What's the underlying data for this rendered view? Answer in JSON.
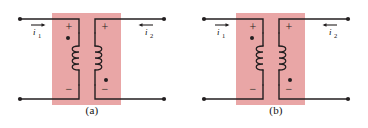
{
  "figure": {
    "type": "coupled-inductors-dot-convention",
    "colors": {
      "core_fill": "#e9a6a6",
      "wire": "#231f20",
      "background": "#ffffff",
      "label": "#111111"
    },
    "panels": [
      {
        "id": "a",
        "caption": "(a)",
        "left_terminal_current": {
          "label": "i",
          "subscript": "1",
          "arrow_direction": "right"
        },
        "right_terminal_current": {
          "label": "i",
          "subscript": "2",
          "arrow_direction": "left"
        },
        "left_coil": {
          "top_polarity": "+",
          "bottom_polarity": "−",
          "dot_position": "top",
          "winding_bulge": "left"
        },
        "right_coil": {
          "top_polarity": "+",
          "bottom_polarity": "−",
          "dot_position": "bottom",
          "winding_bulge": "right"
        }
      },
      {
        "id": "b",
        "caption": "(b)",
        "left_terminal_current": {
          "label": "i",
          "subscript": "1",
          "arrow_direction": "right"
        },
        "right_terminal_current": {
          "label": "i",
          "subscript": "2",
          "arrow_direction": "left"
        },
        "left_coil": {
          "top_polarity": "+",
          "bottom_polarity": "−",
          "dot_position": "top",
          "winding_bulge": "left"
        },
        "right_coil": {
          "top_polarity": "+",
          "bottom_polarity": "−",
          "dot_position": "bottom",
          "winding_bulge": "right"
        }
      }
    ]
  }
}
